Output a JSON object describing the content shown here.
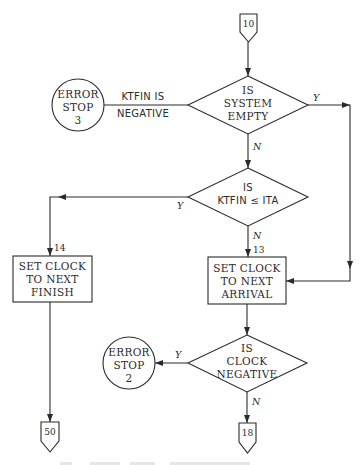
{
  "flowchart": {
    "connectors": {
      "entry": "10",
      "exit_finish": "50",
      "exit_clock": "18"
    },
    "decisions": {
      "system_empty": [
        "IS",
        "SYSTEM",
        "EMPTY"
      ],
      "ktfin_le_ita": [
        "IS",
        "KTFIN ≤ ITA"
      ],
      "clock_negative": [
        "IS",
        "CLOCK",
        "NEGATIVE"
      ]
    },
    "processes": {
      "next_finish": [
        "SET CLOCK",
        "TO NEXT",
        "FINISH"
      ],
      "next_arrival": [
        "SET CLOCK",
        "TO NEXT",
        "ARRIVAL"
      ]
    },
    "terminals": {
      "error_stop_3": [
        "ERROR",
        "STOP",
        "3"
      ],
      "error_stop_2": [
        "ERROR",
        "STOP",
        "2"
      ]
    },
    "edge_labels": {
      "ktfin_negative": [
        "KTFIN IS",
        "NEGATIVE"
      ],
      "yes": "Y",
      "no": "N",
      "step_14": "14",
      "step_13": "13"
    }
  }
}
